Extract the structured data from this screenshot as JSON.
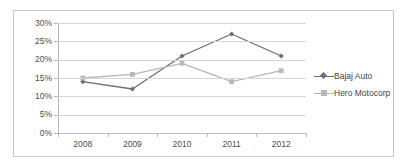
{
  "chart_data": {
    "type": "line",
    "title": "",
    "subtitle": "",
    "xlabel": "",
    "ylabel": "",
    "categories": [
      "2008",
      "2009",
      "2010",
      "2011",
      "2012"
    ],
    "x_tick_labels": [
      "2008",
      "2009",
      "2010",
      "2011",
      "2012"
    ],
    "y_tick_labels": [
      "0%",
      "5%",
      "10%",
      "15%",
      "20%",
      "25%",
      "30%"
    ],
    "y_tick_values": [
      0,
      5,
      10,
      15,
      20,
      25,
      30
    ],
    "ylim": [
      0,
      30
    ],
    "y_unit": "%",
    "grid": true,
    "legend_position": "right",
    "series": [
      {
        "name": "Bajaj Auto",
        "color": "#6e6e6e",
        "marker": "diamond",
        "values": [
          14,
          12,
          21,
          27,
          21
        ]
      },
      {
        "name": "Hero Motocorp",
        "color": "#b8b8b8",
        "marker": "square",
        "values": [
          15,
          16,
          19,
          14,
          17
        ]
      }
    ]
  },
  "legend": {
    "items": [
      {
        "label": "Bajaj Auto"
      },
      {
        "label": "Hero Motocorp"
      }
    ]
  },
  "colors": {
    "series_1": "#6e6e6e",
    "series_2": "#b8b8b8",
    "gridline": "#d6d6d6",
    "axis": "#b5b5b5",
    "border": "#c9c9c9",
    "text": "#4d4d4d",
    "background": "#ffffff"
  }
}
